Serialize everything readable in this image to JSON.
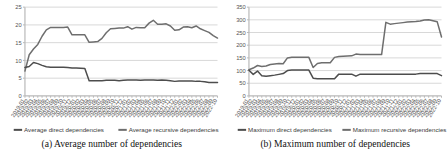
{
  "figure": {
    "background": "#ffffff",
    "panels": [
      {
        "id": "panel-a",
        "caption": "(a) Average number of dependencies",
        "caption_index": "(a)"
      },
      {
        "id": "panel-b",
        "caption": "(b) Maximum number of dependencies",
        "caption_index": "(b)"
      }
    ]
  },
  "colors": {
    "direct": "#4d4d4d",
    "recursive": "#6e6e6e",
    "grid": "#d8d8d8",
    "axis": "#b9b9b9",
    "text": "#555555",
    "caption": "#121212"
  },
  "x_categories": [
    "2019-01",
    "2019-02",
    "2019-03",
    "2019-04",
    "2019-05",
    "2019-06",
    "2019-07",
    "2019-08",
    "2019-09",
    "2019-10",
    "2019-11",
    "2019-12",
    "2020-01",
    "2020-02",
    "2020-03",
    "2020-04",
    "2020-05",
    "2020-06",
    "2020-07",
    "2020-08",
    "2020-09",
    "2020-10",
    "2020-11",
    "2020-12",
    "2021-01",
    "2021-02",
    "2021-03",
    "2021-04",
    "2021-05",
    "2021-06",
    "2021-07",
    "2021-08",
    "2021-09",
    "2021-10",
    "2021-11",
    "2021-12",
    "2022-01",
    "2022-02",
    "2022-03",
    "2022-04",
    "2022-05",
    "2022-06",
    "2022-07",
    "2022-08",
    "2022-09",
    "2022-10"
  ],
  "chart_data": [
    {
      "type": "line",
      "title": "(a) Average number of dependencies",
      "xlabel": "",
      "ylabel": "",
      "ylim": [
        0,
        25
      ],
      "yticks": [
        0,
        5,
        10,
        15,
        20,
        25
      ],
      "grid": true,
      "legend_position": "bottom",
      "categories": [
        "2019-01",
        "2019-02",
        "2019-03",
        "2019-04",
        "2019-05",
        "2019-06",
        "2019-07",
        "2019-08",
        "2019-09",
        "2019-10",
        "2019-11",
        "2019-12",
        "2020-01",
        "2020-02",
        "2020-03",
        "2020-04",
        "2020-05",
        "2020-06",
        "2020-07",
        "2020-08",
        "2020-09",
        "2020-10",
        "2020-11",
        "2020-12",
        "2021-01",
        "2021-02",
        "2021-03",
        "2021-04",
        "2021-05",
        "2021-06",
        "2021-07",
        "2021-08",
        "2021-09",
        "2021-10",
        "2021-11",
        "2021-12",
        "2022-01",
        "2022-02",
        "2022-03",
        "2022-04",
        "2022-05",
        "2022-06",
        "2022-07",
        "2022-08",
        "2022-09",
        "2022-10"
      ],
      "series": [
        {
          "name": "Average recursive dependencies",
          "color": "#6e6e6e",
          "values": [
            7.0,
            11.6,
            13.2,
            14.5,
            16.8,
            18.6,
            19.3,
            19.3,
            19.3,
            19.3,
            19.4,
            17.2,
            17.2,
            17.2,
            17.2,
            15.1,
            15.2,
            15.3,
            16.2,
            17.8,
            18.9,
            19.0,
            19.1,
            19.1,
            19.5,
            18.8,
            19.3,
            19.2,
            19.2,
            20.5,
            21.3,
            20.2,
            20.2,
            20.3,
            19.7,
            18.5,
            18.6,
            19.4,
            19.5,
            19.2,
            19.7,
            18.9,
            18.4,
            17.9,
            17.0,
            16.3
          ]
        },
        {
          "name": "Average direct dependencies",
          "color": "#4d4d4d",
          "values": [
            8.0,
            8.3,
            9.4,
            9.1,
            8.6,
            8.2,
            8.1,
            8.1,
            8.1,
            8.1,
            8.0,
            7.9,
            7.9,
            7.8,
            7.7,
            4.3,
            4.3,
            4.3,
            4.3,
            4.4,
            4.4,
            4.4,
            4.3,
            4.4,
            4.5,
            4.5,
            4.5,
            4.4,
            4.5,
            4.5,
            4.5,
            4.4,
            4.5,
            4.4,
            4.3,
            4.1,
            4.2,
            4.2,
            4.2,
            4.2,
            4.1,
            4.1,
            4.0,
            3.8,
            3.8,
            3.8
          ]
        }
      ]
    },
    {
      "type": "line",
      "title": "(b) Maximum number of dependencies",
      "xlabel": "",
      "ylabel": "",
      "ylim": [
        0,
        350
      ],
      "yticks": [
        0,
        50,
        100,
        150,
        200,
        250,
        300,
        350
      ],
      "grid": true,
      "legend_position": "bottom",
      "categories": [
        "2019-01",
        "2019-02",
        "2019-03",
        "2019-04",
        "2019-05",
        "2019-06",
        "2019-07",
        "2019-08",
        "2019-09",
        "2019-10",
        "2019-11",
        "2019-12",
        "2020-01",
        "2020-02",
        "2020-03",
        "2020-04",
        "2020-05",
        "2020-06",
        "2020-07",
        "2020-08",
        "2020-09",
        "2020-10",
        "2020-11",
        "2020-12",
        "2021-01",
        "2021-02",
        "2021-03",
        "2021-04",
        "2021-05",
        "2021-06",
        "2021-07",
        "2021-08",
        "2021-09",
        "2021-10",
        "2021-11",
        "2021-12",
        "2022-01",
        "2022-02",
        "2022-03",
        "2022-04",
        "2022-05",
        "2022-06",
        "2022-07",
        "2022-08",
        "2022-09",
        "2022-10"
      ],
      "series": [
        {
          "name": "Maximum recursive dependencies",
          "color": "#6e6e6e",
          "values": [
            103,
            110,
            120,
            116,
            118,
            124,
            126,
            128,
            127,
            150,
            152,
            152,
            152,
            152,
            152,
            112,
            128,
            131,
            131,
            131,
            152,
            155,
            156,
            157,
            158,
            165,
            163,
            163,
            163,
            163,
            163,
            163,
            290,
            283,
            285,
            287,
            289,
            291,
            292,
            293,
            295,
            299,
            300,
            296,
            292,
            232
          ]
        },
        {
          "name": "Maximum direct dependencies",
          "color": "#4d4d4d",
          "values": [
            101,
            85,
            98,
            80,
            78,
            80,
            82,
            85,
            88,
            100,
            102,
            102,
            102,
            102,
            102,
            70,
            68,
            68,
            68,
            68,
            68,
            86,
            86,
            86,
            86,
            78,
            86,
            86,
            86,
            86,
            86,
            86,
            86,
            86,
            86,
            86,
            86,
            86,
            86,
            86,
            88,
            88,
            88,
            88,
            88,
            80
          ]
        }
      ]
    }
  ]
}
